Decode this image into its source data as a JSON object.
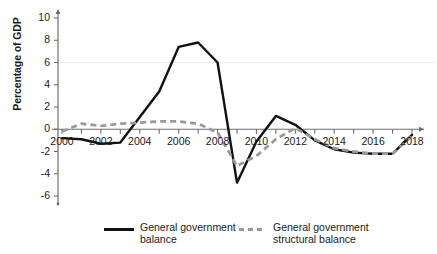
{
  "chart_data": {
    "type": "line",
    "title": "",
    "xlabel": "",
    "ylabel": "Percentage of GDP",
    "xlim": [
      2000,
      2018
    ],
    "ylim": [
      -6,
      10
    ],
    "ytick_labels": [
      "10",
      "8",
      "6",
      "4",
      "2",
      "0",
      "-2",
      "-4",
      "-6"
    ],
    "ytick_values": [
      10,
      8,
      6,
      4,
      2,
      0,
      -2,
      -4,
      -6
    ],
    "xtick_labels": [
      "2000",
      "2002",
      "2004",
      "2006",
      "2008",
      "2010",
      "2012",
      "2014",
      "2016",
      "2018"
    ],
    "xtick_values": [
      2000,
      2002,
      2004,
      2006,
      2008,
      2010,
      2012,
      2014,
      2016,
      2018
    ],
    "x": [
      2000,
      2001,
      2002,
      2003,
      2004,
      2005,
      2006,
      2007,
      2008,
      2009,
      2010,
      2011,
      2012,
      2013,
      2014,
      2015,
      2016,
      2017,
      2018
    ],
    "grid": false,
    "legend_position": "bottom",
    "series": [
      {
        "name": "General government balance",
        "style": "solid",
        "color": "#111111",
        "values": [
          -0.8,
          -0.9,
          -1.3,
          -1.2,
          1.1,
          3.4,
          7.4,
          7.8,
          6.0,
          -4.8,
          -1.1,
          1.2,
          0.4,
          -1.0,
          -1.8,
          -2.1,
          -2.2,
          -2.2,
          -0.5
        ]
      },
      {
        "name": "General government structural balance",
        "style": "dashed",
        "color": "#9a9a9a",
        "values": [
          -0.2,
          0.5,
          0.3,
          0.5,
          0.6,
          0.7,
          0.7,
          0.5,
          -0.3,
          -3.3,
          -2.4,
          -0.9,
          0.1,
          -0.9,
          -1.7,
          -2.0,
          -2.2,
          -2.2,
          -0.6
        ]
      }
    ]
  },
  "legend": {
    "items": [
      {
        "label": "General government\nbalance",
        "style": "solid"
      },
      {
        "label": "General government\nstructural balance",
        "style": "dashed"
      }
    ]
  }
}
